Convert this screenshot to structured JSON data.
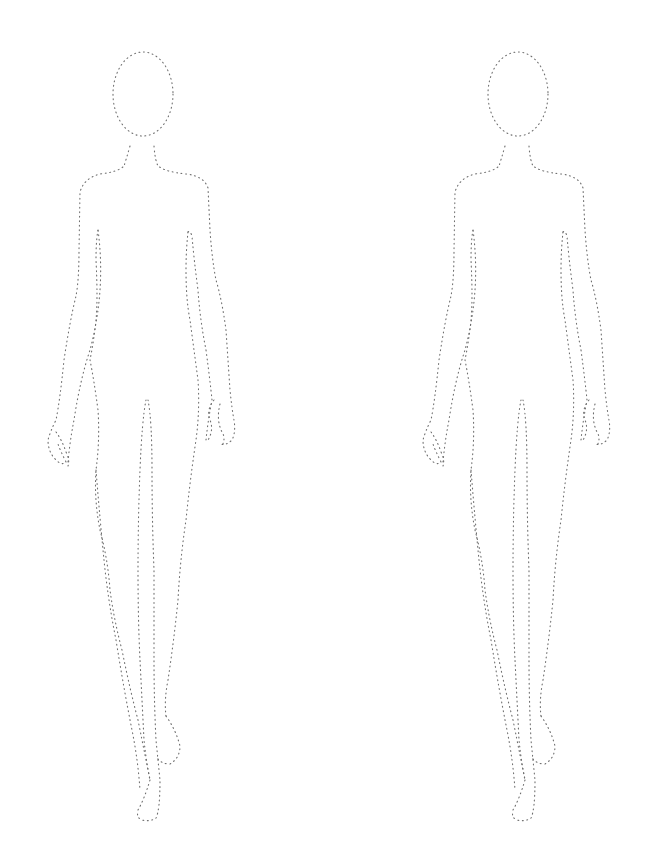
{
  "page": {
    "background": "#ffffff"
  },
  "figures": [
    {
      "id": "figure-left",
      "offset_x": 0,
      "offset_y": 0
    },
    {
      "id": "figure-right",
      "offset_x": 375,
      "offset_y": 0
    }
  ],
  "style": {
    "stroke_color": "#6f6f6f",
    "line_style": "dotted"
  }
}
